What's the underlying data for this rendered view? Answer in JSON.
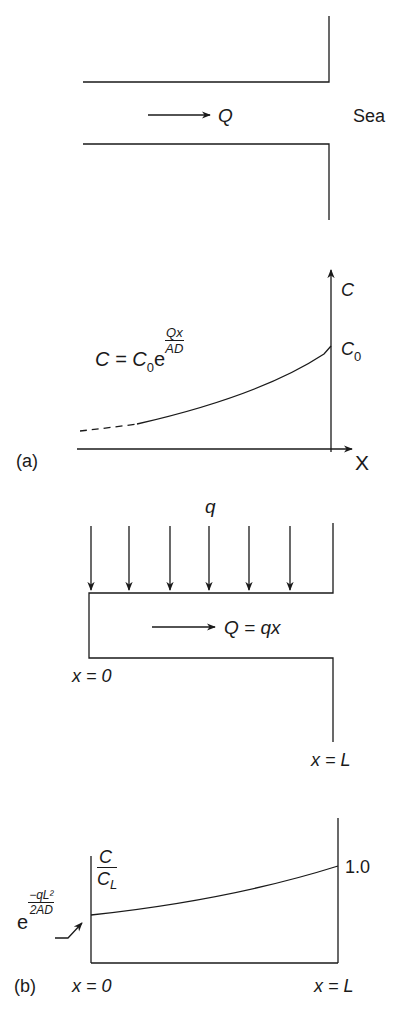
{
  "panel_a": {
    "channel": {
      "flow_label": "Q",
      "sea_label": "Sea"
    },
    "graph": {
      "y_axis_label": "C",
      "x_axis_label": "X",
      "boundary_value_label": "C",
      "boundary_value_sub": "0",
      "equation": {
        "lhs": "C = C",
        "lhs_sub": "0",
        "base": "e",
        "exp_num": "Qx",
        "exp_den": "AD"
      }
    },
    "panel_label": "(a)"
  },
  "panel_b": {
    "channel": {
      "inflow_label": "q",
      "flow_label": "Q = qx",
      "start_label": "x = 0",
      "end_label": "x = L"
    },
    "graph": {
      "y_label_num": "C",
      "y_label_den": "C",
      "y_label_den_sub": "L",
      "right_value_label": "1.0",
      "left_value": {
        "base": "e",
        "exp_num": "−qL²",
        "exp_den": "2AD"
      },
      "x_start_label": "x = 0",
      "x_end_label": "x = L"
    },
    "panel_label": "(b)"
  },
  "colors": {
    "ink": "#1a1a1a",
    "background": "#ffffff"
  }
}
